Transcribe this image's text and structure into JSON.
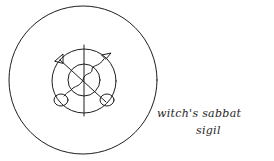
{
  "illustration": {
    "icon": "witch-sabbat-sigil-icon",
    "stroke_color": "#1e1e1e",
    "background_color": "#ffffff"
  },
  "caption": {
    "line1": "witch's sabbat",
    "line2": "sigil"
  }
}
